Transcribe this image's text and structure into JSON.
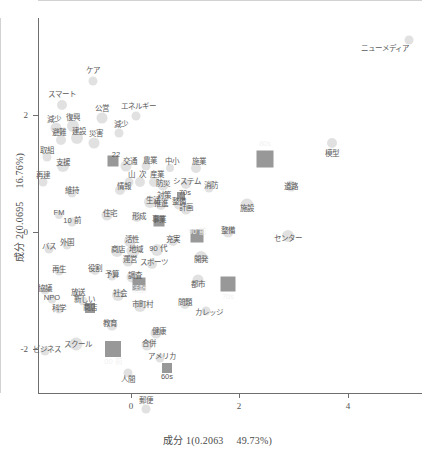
{
  "chart_data": {
    "type": "scatter",
    "title": "",
    "xlabel": "成分 1(0.2063　 49.73%)",
    "ylabel": "成分 2(0.0695　 16.76%)",
    "xlim": [
      -1.35,
      5.1
    ],
    "ylim": [
      -2.9,
      3.3
    ],
    "xticks": [
      0,
      2,
      4
    ],
    "xtick_labels": [
      "0",
      "2",
      "4"
    ],
    "yticks": [
      2,
      0,
      -2
    ],
    "ytick_labels": [
      "2",
      "0",
      "-2"
    ],
    "grid": false,
    "zero_reference_lines": true,
    "legend": "none",
    "marker_colors": {
      "circle": "#dcdcdc",
      "square": "#8f8f8f",
      "label_text": "#5a5a5a",
      "inverted_label_text": "#f2f2f2",
      "axis": "#6e6e6e",
      "zero_line": "#d2d2d2"
    },
    "points": [
      {
        "label": "ニューメディア",
        "x": 4.62,
        "y": 3.02,
        "px": 409,
        "py": 40,
        "marker": "circle",
        "size": 9,
        "lx": 385,
        "ly": 49,
        "anchor": "right"
      },
      {
        "label": "ケア",
        "x": 0.02,
        "y": 2.32,
        "px": 93,
        "py": 81,
        "marker": "circle",
        "size": 9,
        "lx": 93,
        "ly": 71
      },
      {
        "label": "スマート",
        "x": -0.58,
        "y": 2.08,
        "px": 62,
        "py": 105,
        "marker": "circle",
        "size": 10,
        "lx": 62,
        "ly": 95
      },
      {
        "label": "模型",
        "x": 3.42,
        "y": 1.46,
        "px": 332,
        "py": 143,
        "marker": "circle",
        "size": 10,
        "lx": 332,
        "ly": 154
      },
      {
        "label": "公営",
        "x": -0.12,
        "y": 1.86,
        "px": 102,
        "py": 118,
        "marker": "circle",
        "size": 11,
        "lx": 102,
        "ly": 109
      },
      {
        "label": "エネルギー",
        "x": 0.3,
        "y": 1.88,
        "px": 136,
        "py": 116,
        "marker": "circle",
        "size": 9,
        "lx": 138,
        "ly": 107
      },
      {
        "label": "復興",
        "x": -0.7,
        "y": 1.72,
        "px": 73,
        "py": 126,
        "marker": "circle",
        "size": 12,
        "lx": 73,
        "ly": 118
      },
      {
        "label": "減少",
        "x": -0.92,
        "y": 1.7,
        "px": 56,
        "py": 128,
        "marker": "circle",
        "size": 11,
        "lx": 54,
        "ly": 120
      },
      {
        "label": "減少 ",
        "x": 0.12,
        "y": 1.62,
        "px": 119,
        "py": 133,
        "marker": "circle",
        "size": 9,
        "lx": 121,
        "ly": 125
      },
      {
        "label": "建設",
        "x": -0.64,
        "y": 1.48,
        "px": 77,
        "py": 138,
        "marker": "circle",
        "size": 12,
        "lx": 79,
        "ly": 132
      },
      {
        "label": "避難",
        "x": -0.84,
        "y": 1.46,
        "px": 61,
        "py": 140,
        "marker": "circle",
        "size": 10,
        "lx": 59,
        "ly": 133
      },
      {
        "label": "災害",
        "x": -0.44,
        "y": 1.42,
        "px": 94,
        "py": 143,
        "marker": "circle",
        "size": 11,
        "lx": 96,
        "ly": 134
      },
      {
        "label": "取組",
        "x": -1.02,
        "y": 1.14,
        "px": 47,
        "py": 157,
        "marker": "circle",
        "size": 9,
        "lx": 47,
        "ly": 151
      },
      {
        "label": "支援",
        "x": -0.82,
        "y": 1.0,
        "px": 63,
        "py": 166,
        "marker": "circle",
        "size": 12,
        "lx": 63,
        "ly": 163
      },
      {
        "label": "22",
        "x": -0.22,
        "y": 1.08,
        "px": 113,
        "py": 161,
        "marker": "square",
        "size": 11,
        "lx": 116,
        "ly": 155
      },
      {
        "label": "交通",
        "x": 0.18,
        "y": 1.0,
        "px": 126,
        "py": 166,
        "marker": "circle",
        "size": 11,
        "lx": 130,
        "ly": 162
      },
      {
        "label": "農業",
        "x": 0.4,
        "y": 1.0,
        "px": 146,
        "py": 166,
        "marker": "circle",
        "size": 9,
        "lx": 150,
        "ly": 161
      },
      {
        "label": "中小",
        "x": 1.22,
        "y": 0.98,
        "px": 170,
        "py": 168,
        "marker": "circle",
        "size": 8,
        "lx": 172,
        "ly": 162
      },
      {
        "label": "施業",
        "x": 1.6,
        "y": 0.98,
        "px": 196,
        "py": 168,
        "marker": "circle",
        "size": 10,
        "lx": 199,
        "ly": 162
      },
      {
        "label": "80s",
        "x": 2.52,
        "y": 1.12,
        "px": 265,
        "py": 159,
        "marker": "square",
        "size": 17,
        "lx": 265,
        "ly": 144
      },
      {
        "label": "再建",
        "x": -1.08,
        "y": 0.74,
        "px": 43,
        "py": 182,
        "marker": "circle",
        "size": 9,
        "lx": 43,
        "ly": 176
      },
      {
        "label": "維持",
        "x": -0.72,
        "y": 0.56,
        "px": 72,
        "py": 193,
        "marker": "circle",
        "size": 9,
        "lx": 72,
        "ly": 191
      },
      {
        "label": "山",
        "x": 0.22,
        "y": 0.74,
        "px": 129,
        "py": 182,
        "marker": "circle",
        "size": 9,
        "lx": 131,
        "ly": 175
      },
      {
        "label": "次",
        "x": 0.34,
        "y": 0.74,
        "px": 140,
        "py": 182,
        "marker": "circle",
        "size": 10,
        "lx": 142,
        "ly": 175
      },
      {
        "label": "産業",
        "x": 0.5,
        "y": 0.74,
        "px": 154,
        "py": 182,
        "marker": "circle",
        "size": 10,
        "lx": 157,
        "ly": 175
      },
      {
        "label": "情報",
        "x": 0.12,
        "y": 0.6,
        "px": 120,
        "py": 190,
        "marker": "circle",
        "size": 10,
        "lx": 124,
        "ly": 187
      },
      {
        "label": "防災",
        "x": 1.06,
        "y": 0.7,
        "px": 163,
        "py": 185,
        "marker": "circle",
        "size": 11,
        "lx": 163,
        "ly": 184
      },
      {
        "label": "システム",
        "x": 1.34,
        "y": 0.72,
        "px": 186,
        "py": 184,
        "marker": "circle",
        "size": 10,
        "lx": 187,
        "ly": 182
      },
      {
        "label": "消防",
        "x": 1.7,
        "y": 0.64,
        "px": 209,
        "py": 188,
        "marker": "circle",
        "size": 9,
        "lx": 211,
        "ly": 186
      },
      {
        "label": "道路",
        "x": 2.86,
        "y": 0.68,
        "px": 291,
        "py": 186,
        "marker": "circle",
        "size": 11,
        "lx": 291,
        "ly": 187
      },
      {
        "label": "対策",
        "x": 1.06,
        "y": 0.5,
        "px": 164,
        "py": 197,
        "marker": "circle",
        "size": 10,
        "lx": 164,
        "ly": 196
      },
      {
        "label": "70s",
        "x": 1.28,
        "y": 0.52,
        "px": 181,
        "py": 196,
        "marker": "square",
        "size": 8,
        "lx": 185,
        "ly": 193
      },
      {
        "label": "推進",
        "x": 1.02,
        "y": 0.36,
        "px": 161,
        "py": 205,
        "marker": "circle",
        "size": 10,
        "lx": 161,
        "ly": 204
      },
      {
        "label": "整備",
        "x": 1.26,
        "y": 0.38,
        "px": 179,
        "py": 204,
        "marker": "circle",
        "size": 11,
        "lx": 179,
        "ly": 202
      },
      {
        "label": "計画",
        "x": 1.36,
        "y": 0.3,
        "px": 186,
        "py": 209,
        "marker": "circle",
        "size": 11,
        "lx": 186,
        "ly": 208
      },
      {
        "label": "施設",
        "x": 2.26,
        "y": 0.36,
        "px": 247,
        "py": 205,
        "marker": "circle",
        "size": 13,
        "lx": 247,
        "ly": 209
      },
      {
        "label": "FM",
        "x": -0.88,
        "y": 0.22,
        "px": 59,
        "py": 215,
        "marker": "circle",
        "size": 8,
        "lx": 59,
        "ly": 213
      },
      {
        "label": "10 前",
        "x": -0.7,
        "y": 0.1,
        "px": 72,
        "py": 222,
        "marker": "circle",
        "size": 9,
        "lx": 72,
        "ly": 221
      },
      {
        "label": "事業",
        "x": 1.0,
        "y": 0.12,
        "px": 159,
        "py": 221,
        "marker": "square",
        "size": 11,
        "lx": 159,
        "ly": 220
      },
      {
        "label": "住宅",
        "x": -0.08,
        "y": 0.22,
        "px": 107,
        "py": 215,
        "marker": "circle",
        "size": 11,
        "lx": 110,
        "ly": 214
      },
      {
        "label": "生活",
        "x": 0.44,
        "y": 0.44,
        "px": 150,
        "py": 202,
        "marker": "circle",
        "size": 12,
        "lx": 153,
        "ly": 201
      },
      {
        "label": "形成",
        "x": 0.28,
        "y": 0.18,
        "px": 137,
        "py": 217,
        "marker": "circle",
        "size": 10,
        "lx": 139,
        "ly": 217
      },
      {
        "label": "整備 ",
        "x": 1.96,
        "y": 0.0,
        "px": 228,
        "py": 232,
        "marker": "circle",
        "size": 11,
        "lx": 228,
        "ly": 231
      },
      {
        "label": "90 前",
        "x": 1.52,
        "y": -0.06,
        "px": 197,
        "py": 236,
        "marker": "square",
        "size": 13,
        "lx": 197,
        "ly": 232
      },
      {
        "label": "充実",
        "x": 1.18,
        "y": -0.14,
        "px": 173,
        "py": 241,
        "marker": "circle",
        "size": 10,
        "lx": 173,
        "ly": 240
      },
      {
        "label": "センター",
        "x": 2.82,
        "y": -0.06,
        "px": 288,
        "py": 236,
        "marker": "circle",
        "size": 12,
        "lx": 288,
        "ly": 239
      },
      {
        "label": "活性",
        "x": 0.22,
        "y": -0.14,
        "px": 130,
        "py": 241,
        "marker": "circle",
        "size": 12,
        "lx": 132,
        "ly": 240
      },
      {
        "label": "外国",
        "x": -0.78,
        "y": -0.2,
        "px": 67,
        "py": 245,
        "marker": "circle",
        "size": 9,
        "lx": 67,
        "ly": 243
      },
      {
        "label": "地域",
        "x": 0.26,
        "y": -0.3,
        "px": 133,
        "py": 251,
        "marker": "circle",
        "size": 13,
        "lx": 136,
        "ly": 250
      },
      {
        "label": "商店",
        "x": 0.08,
        "y": -0.3,
        "px": 117,
        "py": 251,
        "marker": "circle",
        "size": 12,
        "lx": 118,
        "ly": 250
      },
      {
        "label": "90 代",
        "x": 0.98,
        "y": -0.28,
        "px": 157,
        "py": 250,
        "marker": "circle",
        "size": 12,
        "lx": 158,
        "ly": 249
      },
      {
        "label": "開発",
        "x": 1.68,
        "y": -0.4,
        "px": 201,
        "py": 257,
        "marker": "circle",
        "size": 12,
        "lx": 201,
        "ly": 260
      },
      {
        "label": "バス",
        "x": -1.0,
        "y": -0.26,
        "px": 49,
        "py": 249,
        "marker": "circle",
        "size": 9,
        "lx": 49,
        "ly": 247
      },
      {
        "label": "運営",
        "x": 0.2,
        "y": -0.46,
        "px": 128,
        "py": 261,
        "marker": "circle",
        "size": 11,
        "lx": 130,
        "ly": 260
      },
      {
        "label": "スポーツ",
        "x": 0.56,
        "y": -0.5,
        "px": 152,
        "py": 264,
        "marker": "circle",
        "size": 10,
        "lx": 154,
        "ly": 263
      },
      {
        "label": "再生",
        "x": -0.88,
        "y": -0.62,
        "px": 59,
        "py": 271,
        "marker": "circle",
        "size": 9,
        "lx": 59,
        "ly": 270
      },
      {
        "label": "役割",
        "x": -0.42,
        "y": -0.6,
        "px": 95,
        "py": 270,
        "marker": "circle",
        "size": 10,
        "lx": 95,
        "ly": 269
      },
      {
        "label": "予算",
        "x": -0.2,
        "y": -0.7,
        "px": 112,
        "py": 276,
        "marker": "circle",
        "size": 9,
        "lx": 112,
        "ly": 275
      },
      {
        "label": "調査",
        "x": 0.06,
        "y": -0.72,
        "px": 132,
        "py": 277,
        "marker": "circle",
        "size": 11,
        "lx": 135,
        "ly": 276
      },
      {
        "label": "活動",
        "x": 0.32,
        "y": -0.84,
        "px": 139,
        "py": 284,
        "marker": "square",
        "size": 13,
        "lx": 139,
        "ly": 290
      },
      {
        "label": "都市",
        "x": 1.64,
        "y": -0.76,
        "px": 198,
        "py": 280,
        "marker": "circle",
        "size": 11,
        "lx": 198,
        "ly": 285
      },
      {
        "label": "70s ",
        "x": 2.22,
        "y": -0.84,
        "px": 228,
        "py": 284,
        "marker": "square",
        "size": 15,
        "lx": 228,
        "ly": 297
      },
      {
        "label": "協議",
        "x": -1.06,
        "y": -0.94,
        "px": 45,
        "py": 290,
        "marker": "circle",
        "size": 9,
        "lx": 45,
        "ly": 289
      },
      {
        "label": "放送",
        "x": -0.58,
        "y": -1.0,
        "px": 78,
        "py": 294,
        "marker": "circle",
        "size": 9,
        "lx": 78,
        "ly": 293
      },
      {
        "label": "NPO",
        "x": -0.98,
        "y": -1.08,
        "px": 52,
        "py": 299,
        "marker": "circle",
        "size": 9,
        "lx": 52,
        "ly": 298
      },
      {
        "label": "新しい",
        "x": -0.5,
        "y": -1.12,
        "px": 83,
        "py": 301,
        "marker": "circle",
        "size": 9,
        "lx": 84,
        "ly": 300
      },
      {
        "label": "社会",
        "x": 0.02,
        "y": -1.02,
        "px": 118,
        "py": 295,
        "marker": "circle",
        "size": 12,
        "lx": 120,
        "ly": 294
      },
      {
        "label": "市町村",
        "x": 0.34,
        "y": -1.2,
        "px": 140,
        "py": 306,
        "marker": "circle",
        "size": 12,
        "lx": 142,
        "ly": 305
      },
      {
        "label": "問題",
        "x": 1.2,
        "y": -1.16,
        "px": 185,
        "py": 304,
        "marker": "circle",
        "size": 10,
        "lx": 185,
        "ly": 303
      },
      {
        "label": "カレッジ",
        "x": 1.78,
        "y": -1.28,
        "px": 206,
        "py": 311,
        "marker": "circle",
        "size": 9,
        "lx": 209,
        "ly": 313
      },
      {
        "label": "商店 ",
        "x": -0.42,
        "y": -1.24,
        "px": 90,
        "py": 308,
        "marker": "square",
        "size": 10,
        "lx": 90,
        "ly": 308
      },
      {
        "label": "科学",
        "x": -0.9,
        "y": -1.26,
        "px": 59,
        "py": 309,
        "marker": "circle",
        "size": 9,
        "lx": 59,
        "ly": 309
      },
      {
        "label": "教育",
        "x": -0.12,
        "y": -1.52,
        "px": 112,
        "py": 325,
        "marker": "circle",
        "size": 11,
        "lx": 110,
        "ly": 324
      },
      {
        "label": "健康",
        "x": 0.9,
        "y": -1.66,
        "px": 156,
        "py": 333,
        "marker": "circle",
        "size": 11,
        "lx": 159,
        "ly": 332
      },
      {
        "label": "スクール",
        "x": -0.64,
        "y": -1.84,
        "px": 76,
        "py": 344,
        "marker": "circle",
        "size": 13,
        "lx": 78,
        "ly": 345
      },
      {
        "label": "ビジネス",
        "x": -1.06,
        "y": -1.96,
        "px": 45,
        "py": 351,
        "marker": "circle",
        "size": 9,
        "lx": 47,
        "ly": 350
      },
      {
        "label": "00 前",
        "x": -0.18,
        "y": -1.92,
        "px": 113,
        "py": 349,
        "marker": "square",
        "size": 16,
        "lx": 113,
        "ly": 362
      },
      {
        "label": "合併",
        "x": 0.66,
        "y": -1.86,
        "px": 147,
        "py": 345,
        "marker": "circle",
        "size": 11,
        "lx": 149,
        "ly": 344
      },
      {
        "label": "アメリカ",
        "x": 0.86,
        "y": -2.08,
        "px": 160,
        "py": 358,
        "marker": "circle",
        "size": 9,
        "lx": 162,
        "ly": 357
      },
      {
        "label": "60s",
        "x": 0.94,
        "y": -2.26,
        "px": 167,
        "py": 368,
        "marker": "square",
        "size": 10,
        "lx": 167,
        "ly": 377
      },
      {
        "label": "人間",
        "x": 0.2,
        "y": -2.34,
        "px": 128,
        "py": 373,
        "marker": "circle",
        "size": 9,
        "lx": 128,
        "ly": 380
      },
      {
        "label": "郵便",
        "x": 0.48,
        "y": -2.82,
        "px": 146,
        "py": 409,
        "marker": "circle",
        "size": 9,
        "lx": 146,
        "ly": 401
      }
    ]
  },
  "axes": {
    "x_title": "成分 1(0.2063　 49.73%)",
    "y_title": "成分 2(0.0695　 16.76%)",
    "x_ticks": [
      {
        "label": "0",
        "px": 131
      },
      {
        "label": "2",
        "px": 239
      },
      {
        "label": "4",
        "px": 348
      }
    ],
    "y_ticks": [
      {
        "label": "2",
        "py": 115
      },
      {
        "label": "0",
        "py": 232
      },
      {
        "label": "-2",
        "py": 349
      }
    ],
    "zero_h_py": 232,
    "zero_v_px": 131
  }
}
